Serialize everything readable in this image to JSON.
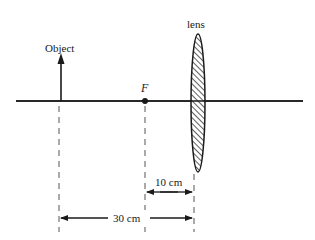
{
  "diagram": {
    "type": "optics-thin-lens",
    "labels": {
      "object": "Object",
      "lens": "lens",
      "focal_point": "F",
      "dim_short": "10 cm",
      "dim_long": "30 cm"
    },
    "colors": {
      "line": "#1a1a1a",
      "dash": "#555555",
      "background": "#ffffff"
    }
  }
}
